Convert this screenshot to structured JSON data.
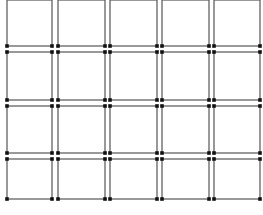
{
  "diagram": {
    "type": "grid-of-cells",
    "rows": 4,
    "columns": 5,
    "line_color": "#555555",
    "node_color": "#111111",
    "background": "#ffffff",
    "column_edges": [
      [
        7,
        52
      ],
      [
        58,
        105
      ],
      [
        110,
        157
      ],
      [
        162,
        209
      ],
      [
        214,
        260
      ]
    ],
    "row_edges": [
      [
        0,
        46
      ],
      [
        52,
        100
      ],
      [
        106,
        153
      ],
      [
        159,
        199
      ]
    ]
  }
}
